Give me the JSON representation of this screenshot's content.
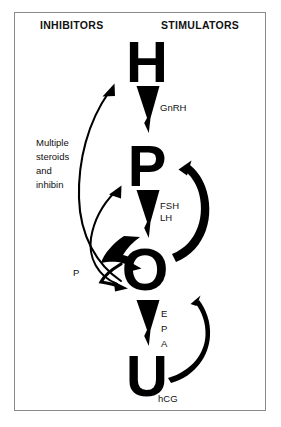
{
  "diagram": {
    "title_columns": {
      "inhibitors": "INHIBITORS",
      "stimulators": "STIMULATORS"
    },
    "nodes": [
      {
        "key": "h",
        "letter": "H",
        "meaning": "Hypothalamus"
      },
      {
        "key": "p",
        "letter": "P",
        "meaning": "Pituitary"
      },
      {
        "key": "o",
        "letter": "O",
        "meaning": "Ovary"
      },
      {
        "key": "u",
        "letter": "U",
        "meaning": "Uterus"
      }
    ],
    "stimulator_labels": {
      "gnrh": "GnRH",
      "fsh": "FSH",
      "lh": "LH",
      "e": "E",
      "p": "P",
      "a": "A",
      "hcg": "hCG"
    },
    "inhibitor_labels": {
      "multiple_steroids_line1": "Multiple",
      "multiple_steroids_line2": "steroids",
      "multiple_steroids_line3": "and",
      "multiple_steroids_line4": "inhibin",
      "progesterone": "P"
    },
    "colors": {
      "ink": "#000000",
      "frame": "#8a8a8a",
      "background": "#ffffff"
    }
  }
}
